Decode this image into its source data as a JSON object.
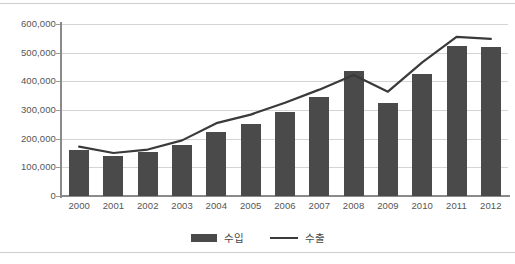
{
  "chart_data": {
    "type": "bar",
    "title": "",
    "subtitle": "",
    "xlabel": "",
    "ylabel": "",
    "categories": [
      "2000",
      "2001",
      "2002",
      "2003",
      "2004",
      "2005",
      "2006",
      "2007",
      "2008",
      "2009",
      "2010",
      "2011",
      "2012"
    ],
    "ylim": [
      0,
      600000
    ],
    "yticks": [
      0,
      100000,
      200000,
      300000,
      400000,
      500000,
      600000
    ],
    "ytick_labels": [
      "0",
      "100,000",
      "200,000",
      "300,000",
      "400,000",
      "500,000",
      "600,000"
    ],
    "grid": true,
    "legend_position": "bottom",
    "series": [
      {
        "name": "수입",
        "kind": "bar",
        "color": "#4a4a4a",
        "values": [
          160000,
          141000,
          152000,
          178000,
          224000,
          251000,
          294000,
          345000,
          435000,
          323000,
          425000,
          524000,
          519000
        ]
      },
      {
        "name": "수출",
        "kind": "line",
        "color": "#3a3a3a",
        "values": [
          172000,
          150000,
          162000,
          194000,
          254000,
          284000,
          325000,
          371000,
          422000,
          364000,
          466000,
          555000,
          548000
        ]
      }
    ]
  },
  "legend": {
    "items": [
      {
        "label": "수입",
        "type": "bar"
      },
      {
        "label": "수출",
        "type": "line"
      }
    ]
  }
}
